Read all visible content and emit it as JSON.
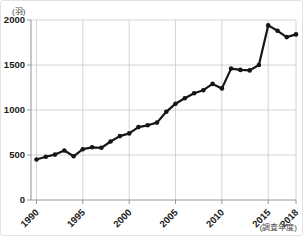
{
  "figure": {
    "unit_label": "(羽)",
    "survey_year_label": "(調査年度)"
  },
  "chart_data": {
    "type": "line",
    "title": "",
    "xlabel": "(調査年度)",
    "ylabel": "(羽)",
    "x": [
      1990,
      1991,
      1992,
      1993,
      1994,
      1995,
      1996,
      1997,
      1998,
      1999,
      2000,
      2001,
      2002,
      2003,
      2004,
      2005,
      2006,
      2007,
      2008,
      2009,
      2010,
      2011,
      2012,
      2013,
      2014,
      2015,
      2016,
      2017,
      2018
    ],
    "values": [
      450,
      480,
      505,
      550,
      485,
      565,
      585,
      580,
      650,
      710,
      740,
      810,
      830,
      860,
      980,
      1070,
      1130,
      1185,
      1220,
      1290,
      1240,
      1460,
      1445,
      1440,
      1500,
      1940,
      1880,
      1810,
      1840
    ],
    "ylim": [
      0,
      2000
    ],
    "yticks": [
      0,
      500,
      1000,
      1500,
      2000
    ],
    "xticks": [
      1990,
      1995,
      2000,
      2005,
      2010,
      2015,
      2018
    ],
    "grid": true,
    "legend": "none",
    "line_color": "#161616",
    "marker_color": "#161616",
    "grid_color": "#c9c9c9",
    "axis_color": "#9a9a9a",
    "tick_label_color": "#1a1a1a"
  }
}
